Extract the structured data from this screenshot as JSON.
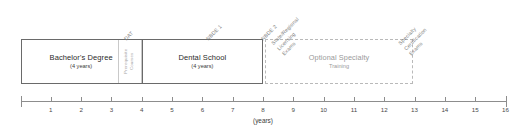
{
  "diagram": {
    "axis": {
      "caption": "(years)",
      "min": 0,
      "max": 16,
      "ticks": [
        0,
        1,
        2,
        3,
        4,
        5,
        6,
        7,
        8,
        9,
        10,
        11,
        12,
        13,
        14,
        15,
        16
      ],
      "tick_labels": [
        "",
        "1",
        "2",
        "3",
        "4",
        "5",
        "6",
        "7",
        "8",
        "9",
        "10",
        "11",
        "12",
        "13",
        "14",
        "15",
        "16"
      ],
      "line_color": "#8d8d8d"
    },
    "stages": [
      {
        "id": "bachelors",
        "title": "Bachelor's Degree",
        "subtitle": "(4 years)",
        "start_year": 0,
        "end_year": 4,
        "style": "solid"
      },
      {
        "id": "dental-school",
        "title": "Dental School",
        "subtitle": "(4 years)",
        "start_year": 4,
        "end_year": 8,
        "style": "solid"
      },
      {
        "id": "optional-specialty",
        "title": "Optional Specialty",
        "subtitle": "Training",
        "start_year": 8,
        "end_year": 12.95,
        "style": "dashed"
      }
    ],
    "inset": {
      "id": "prerequisite-courses",
      "lines": [
        "Prerequisite",
        "Courses"
      ],
      "start_year": 3.2,
      "end_year": 4.0
    },
    "exams": [
      {
        "id": "dat",
        "lines": [
          "DAT"
        ],
        "year": 3.55
      },
      {
        "id": "nbde-1",
        "lines": [
          "NBDE 1"
        ],
        "year": 6.25
      },
      {
        "id": "nbde-2",
        "lines": [
          "NBDE 2"
        ],
        "year": 8.05
      },
      {
        "id": "state-regional-licensing-exams",
        "lines": [
          "State/Regional",
          "Licensing",
          "Exams"
        ],
        "year": 8.75
      },
      {
        "id": "specialty-certification-exams",
        "lines": [
          "Specialty",
          "Certification",
          "Exams"
        ],
        "year": 12.95
      }
    ]
  }
}
